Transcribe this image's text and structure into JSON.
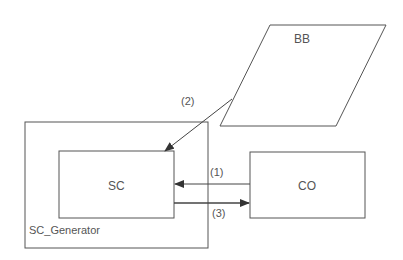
{
  "diagram": {
    "nodes": {
      "bb": {
        "label": "BB",
        "shape": "parallelogram"
      },
      "sc_generator": {
        "label": "SC_Generator",
        "shape": "rectangle"
      },
      "sc": {
        "label": "SC",
        "shape": "rectangle"
      },
      "co": {
        "label": "CO",
        "shape": "rectangle"
      }
    },
    "edges": [
      {
        "id": "e1",
        "label": "(1)",
        "from": "CO",
        "to": "SC"
      },
      {
        "id": "e2",
        "label": "(2)",
        "from": "BB",
        "to": "SC"
      },
      {
        "id": "e3",
        "label": "(3)",
        "from": "SC",
        "to": "CO"
      }
    ],
    "colors": {
      "stroke": "#555555",
      "text": "#555555",
      "background": "#ffffff"
    }
  }
}
